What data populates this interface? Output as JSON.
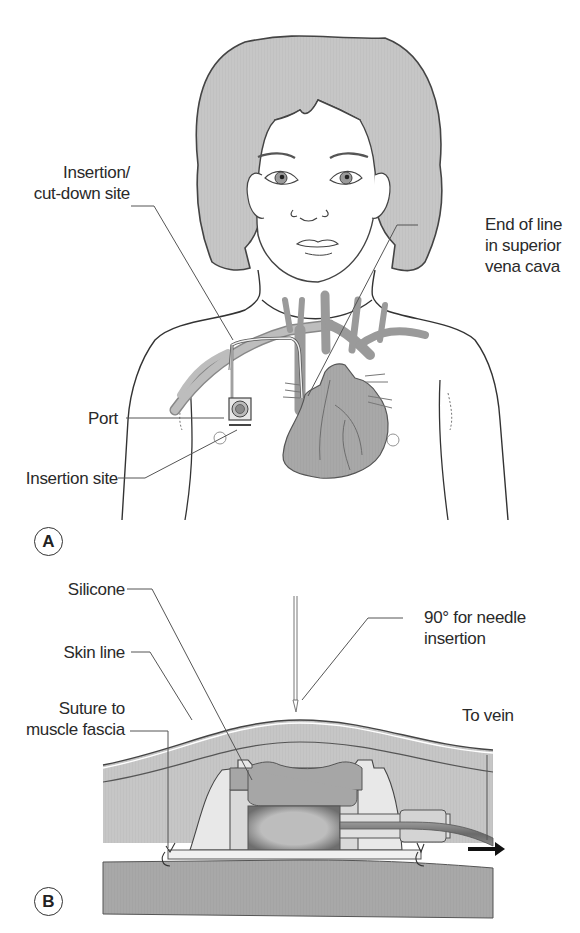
{
  "figure": {
    "panels": [
      {
        "id": "A",
        "badge": "A",
        "subject": "child upper body with implanted central venous port",
        "labels": {
          "insertion_cutdown_line1": "Insertion/",
          "insertion_cutdown_line2": "cut-down site",
          "end_of_line_line1": "End of line",
          "end_of_line_line2": "in superior",
          "end_of_line_line3": "vena cava",
          "port": "Port",
          "insertion_site": "Insertion site"
        }
      },
      {
        "id": "B",
        "badge": "B",
        "subject": "cross-section of implanted port under skin",
        "labels": {
          "silicone": "Silicone",
          "skin_line": "Skin line",
          "needle_line1": "90° for needle",
          "needle_line2": "insertion",
          "suture_line1": "Suture to",
          "suture_line2": "muscle fascia",
          "to_vein": "To vein"
        }
      }
    ],
    "colors": {
      "tissue_gray": "#c9c9c9",
      "hair_gray": "#c4c4c4",
      "muscle_gray": "#a9a9a9",
      "port_body": "#e6e6e6",
      "outline": "#3a3a3a",
      "leader_line": "#555555",
      "background": "#ffffff"
    }
  }
}
